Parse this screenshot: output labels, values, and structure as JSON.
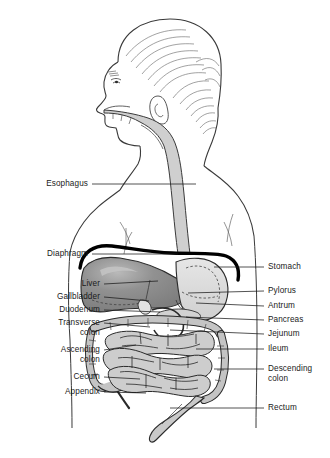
{
  "figure": {
    "background_color": "#ffffff",
    "line_color": "#1a1a1a",
    "colors": {
      "liver": "#8d8d8d",
      "liver_highlight": "#b4b4b4",
      "stomach": "#dcdcdc",
      "intestine": "#c9c9c9",
      "colon": "#bdbdbd",
      "esophagus": "#cfcfcf",
      "diaphragm": "#000000",
      "skin_outline": "#3a3a3a"
    }
  },
  "labels_left": [
    {
      "id": "esophagus",
      "text": "Esophagus",
      "line2": "",
      "x": 88,
      "y": 184,
      "lx1": 92,
      "ly1": 184,
      "lx2": 196,
      "ly2": 184
    },
    {
      "id": "diaphragm",
      "text": "Diaphragm",
      "line2": "",
      "x": 88,
      "y": 254,
      "lx1": 92,
      "ly1": 254,
      "lx2": 178,
      "ly2": 254
    },
    {
      "id": "liver",
      "text": "Liver",
      "line2": "",
      "x": 100,
      "y": 284,
      "lx1": 104,
      "ly1": 284,
      "lx2": 158,
      "ly2": 281
    },
    {
      "id": "gallbladder",
      "text": "Gallbladder",
      "line2": "",
      "x": 100,
      "y": 297,
      "lx1": 104,
      "ly1": 297,
      "lx2": 149,
      "ly2": 300
    },
    {
      "id": "duodenum",
      "text": "Duodenum",
      "line2": "",
      "x": 100,
      "y": 310,
      "lx1": 104,
      "ly1": 310,
      "lx2": 160,
      "ly2": 312
    },
    {
      "id": "transverse-colon",
      "text": "Transverse",
      "line2": "colon",
      "x": 100,
      "y": 323,
      "lx1": 104,
      "ly1": 323,
      "lx2": 150,
      "ly2": 327
    },
    {
      "id": "ascending-colon",
      "text": "Ascending",
      "line2": "colon",
      "x": 100,
      "y": 350,
      "lx1": 104,
      "ly1": 350,
      "lx2": 136,
      "ly2": 345
    },
    {
      "id": "cecum",
      "text": "Cecum",
      "line2": "",
      "x": 100,
      "y": 377,
      "lx1": 104,
      "ly1": 377,
      "lx2": 140,
      "ly2": 379
    },
    {
      "id": "appendix",
      "text": "Appendix",
      "line2": "",
      "x": 100,
      "y": 392,
      "lx1": 104,
      "ly1": 392,
      "lx2": 146,
      "ly2": 392
    }
  ],
  "labels_right": [
    {
      "id": "stomach",
      "text": "Stomach",
      "line2": "",
      "x": 268,
      "y": 267,
      "lx1": 264,
      "ly1": 267,
      "lx2": 214,
      "ly2": 267
    },
    {
      "id": "pylorus",
      "text": "Pylorus",
      "line2": "",
      "x": 268,
      "y": 291,
      "lx1": 264,
      "ly1": 291,
      "lx2": 188,
      "ly2": 293
    },
    {
      "id": "antrum",
      "text": "Antrum",
      "line2": "",
      "x": 268,
      "y": 306,
      "lx1": 264,
      "ly1": 306,
      "lx2": 196,
      "ly2": 303
    },
    {
      "id": "pancreas",
      "text": "Pancreas",
      "line2": "",
      "x": 268,
      "y": 320,
      "lx1": 264,
      "ly1": 320,
      "lx2": 186,
      "ly2": 317
    },
    {
      "id": "jejunum",
      "text": "Jejunum",
      "line2": "",
      "x": 268,
      "y": 334,
      "lx1": 264,
      "ly1": 334,
      "lx2": 170,
      "ly2": 330
    },
    {
      "id": "ileum",
      "text": "Ileum",
      "line2": "",
      "x": 268,
      "y": 349,
      "lx1": 264,
      "ly1": 349,
      "lx2": 196,
      "ly2": 349
    },
    {
      "id": "descending-colon",
      "text": "Descending",
      "line2": "colon",
      "x": 268,
      "y": 369,
      "lx1": 264,
      "ly1": 369,
      "lx2": 214,
      "ly2": 369
    },
    {
      "id": "rectum",
      "text": "Rectum",
      "line2": "",
      "x": 268,
      "y": 408,
      "lx1": 264,
      "ly1": 408,
      "lx2": 170,
      "ly2": 408
    }
  ]
}
